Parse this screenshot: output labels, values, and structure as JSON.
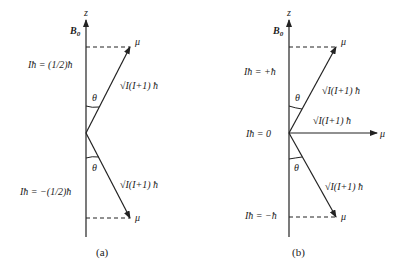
{
  "panel_a": {
    "axis_label": "z",
    "field_label": "B",
    "field_sub": "0",
    "upper_level": "Iħ = (1/2)ħ",
    "lower_level": "Iħ = −(1/2)ħ",
    "vector_label_top": "√I(I+1) ħ",
    "vector_label_bottom": "√I(I+1) ħ",
    "mu_top": "μ",
    "mu_bottom": "μ",
    "theta_top": "θ",
    "theta_bottom": "θ",
    "caption": "(a)"
  },
  "panel_b": {
    "axis_label": "z",
    "field_label": "B",
    "field_sub": "0",
    "upper_level": "Iħ = +ħ",
    "middle_level": "Iħ = 0",
    "lower_level": "Iħ = −ħ",
    "vector_label_top": "√I(I+1) ħ",
    "vector_label_middle": "√I(I+1) ħ",
    "vector_label_bottom": "√I(I+1) ħ",
    "mu_top": "μ",
    "mu_middle": "μ",
    "mu_bottom": "μ",
    "theta_top": "θ",
    "theta_bottom": "θ",
    "caption": "(b)"
  },
  "colors": {
    "line": "#222222",
    "background": "#ffffff"
  }
}
